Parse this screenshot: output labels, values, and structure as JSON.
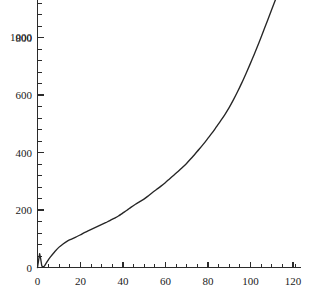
{
  "chart_data": {
    "type": "line",
    "title": "",
    "subtitle": "",
    "xlabel": "",
    "ylabel": "",
    "xlim": [
      0,
      124
    ],
    "ylim": [
      0,
      1165
    ],
    "grid": false,
    "legend": null,
    "x_ticks_major": [
      0,
      20,
      40,
      60,
      80,
      100,
      120
    ],
    "x_tick_labels": [
      "0",
      "20",
      "40",
      "60",
      "80",
      "100",
      "120"
    ],
    "x_tick_minor_step": 5,
    "y_ticks_major": [
      0,
      200,
      400,
      600,
      800,
      1000
    ],
    "y_tick_labels": [
      "0",
      "200",
      "400",
      "600",
      "800",
      "1000"
    ],
    "y_tick_minor_step": 50,
    "series": [
      {
        "name": "curve",
        "color": "#262626",
        "x": [
          0,
          1,
          1.5,
          2,
          2.5,
          3,
          4,
          5,
          6,
          8,
          10,
          12,
          14,
          16,
          18,
          20,
          22,
          24,
          26,
          28,
          30,
          32,
          34,
          36,
          38,
          40,
          42,
          44,
          46,
          48,
          50,
          52,
          54,
          56,
          58,
          60,
          62,
          64,
          66,
          68,
          70,
          72,
          74,
          76,
          78,
          80,
          82,
          84,
          86,
          88,
          90,
          92,
          94,
          96,
          98,
          100,
          102,
          104,
          106,
          108,
          110,
          112,
          114,
          116,
          118,
          120
        ],
        "y": [
          0,
          48,
          30,
          6,
          1,
          3,
          14,
          26,
          36,
          54,
          70,
          82,
          92,
          99,
          106,
          113,
          121,
          128,
          135,
          142,
          149,
          156,
          163,
          171,
          179,
          189,
          199,
          210,
          220,
          229,
          238,
          249,
          261,
          272,
          283,
          295,
          308,
          321,
          334,
          348,
          362,
          378,
          395,
          412,
          430,
          449,
          468,
          489,
          510,
          532,
          556,
          583,
          612,
          643,
          676,
          710,
          745,
          782,
          820,
          858,
          897,
          936,
          975,
          1020,
          1080,
          1152
        ]
      }
    ],
    "annotations": []
  },
  "colors": {
    "background": "#ffffff",
    "axis": "#2b2b2b",
    "curve": "#262626",
    "tick_text": "#1a1a1a"
  },
  "y_axis_labels": {
    "l0": "0",
    "l1": "200",
    "l2": "400",
    "l3": "600",
    "l4": "800",
    "l5": "1000"
  },
  "x_axis_labels": {
    "l0": "0",
    "l1": "20",
    "l2": "40",
    "l3": "60",
    "l4": "80",
    "l5": "100",
    "l6": "120"
  }
}
